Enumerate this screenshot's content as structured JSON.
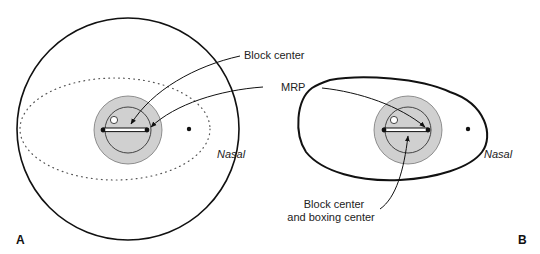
{
  "figure": {
    "panels": [
      {
        "id": "A",
        "label": "A",
        "shape": "round uncut lens blank",
        "labels": {
          "block_center": "Block center",
          "mrp": "MRP",
          "nasal": "Nasal"
        }
      },
      {
        "id": "B",
        "label": "B",
        "shape": "edged lens frame shape",
        "labels": {
          "block_boxing_line1": "Block center",
          "block_boxing_line2": "and boxing center",
          "nasal": "Nasal"
        }
      }
    ],
    "colors": {
      "outline": "#111111",
      "block_fill": "#d0d0d0",
      "text": "#222222",
      "dotted": "#555555"
    }
  }
}
